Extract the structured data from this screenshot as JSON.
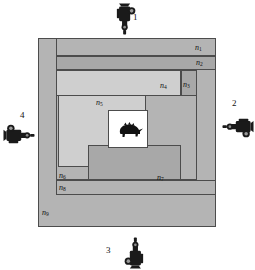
{
  "figure": {
    "center_subject": "armadillo-silhouette",
    "background_color": "#ffffff",
    "outline_color": "#4c4c4c"
  },
  "regions": [
    {
      "id": "n1",
      "label": "n",
      "sub": "1",
      "shade": "#b4b4b4",
      "x": 56,
      "y": 38,
      "w": 160,
      "h": 18,
      "label_x": 195,
      "label_y": 44
    },
    {
      "id": "n2",
      "label": "n",
      "sub": "2",
      "shade": "#a8a8a8",
      "x": 56,
      "y": 56,
      "w": 160,
      "h": 14,
      "label_x": 196,
      "label_y": 59
    },
    {
      "id": "n3",
      "label": "n",
      "sub": "3",
      "shade": "#a8a8a8",
      "x": 181,
      "y": 70,
      "w": 16,
      "h": 110,
      "label_x": 183,
      "label_y": 81
    },
    {
      "id": "n4",
      "label": "n",
      "sub": "4",
      "shade": "#cfcfcf",
      "x": 56,
      "y": 70,
      "w": 125,
      "h": 95,
      "label_x": 160,
      "label_y": 82
    },
    {
      "id": "n5",
      "label": "n",
      "sub": "5",
      "shade": "#cfcfcf",
      "x": 58,
      "y": 95,
      "w": 88,
      "h": 72,
      "label_x": 96,
      "label_y": 99
    },
    {
      "id": "n6",
      "label": "n",
      "sub": "6",
      "shade": "#b4b4b4",
      "x": 56,
      "y": 95,
      "w": 141,
      "h": 85,
      "label_x": 59,
      "label_y": 172
    },
    {
      "id": "n7",
      "label": "n",
      "sub": "7",
      "shade": "#a8a8a8",
      "x": 88,
      "y": 145,
      "w": 93,
      "h": 35,
      "label_x": 157,
      "label_y": 174
    },
    {
      "id": "n8",
      "label": "n",
      "sub": "8",
      "shade": "#b4b4b4",
      "x": 56,
      "y": 180,
      "w": 160,
      "h": 15,
      "label_x": 59,
      "label_y": 184
    },
    {
      "id": "n9",
      "label": "n",
      "sub": "9",
      "shade": "#b4b4b4",
      "x": 38,
      "y": 38,
      "w": 178,
      "h": 189,
      "label_x": 42,
      "label_y": 209
    }
  ],
  "center_box": {
    "x": 108,
    "y": 110,
    "w": 40,
    "h": 38,
    "fill": "#ffffff"
  },
  "cameras": [
    {
      "id": "camera-1",
      "number": "1",
      "direction": "down",
      "x": 108,
      "y": 2,
      "num_x": 133,
      "num_y": 13
    },
    {
      "id": "camera-2",
      "number": "2",
      "direction": "left",
      "x": 221,
      "y": 110,
      "num_x": 232,
      "num_y": 99
    },
    {
      "id": "camera-3",
      "number": "3",
      "direction": "up",
      "x": 118,
      "y": 236,
      "num_x": 106,
      "num_y": 246
    },
    {
      "id": "camera-4",
      "number": "4",
      "direction": "right",
      "x": 2,
      "y": 118,
      "num_x": 20,
      "num_y": 111
    }
  ]
}
